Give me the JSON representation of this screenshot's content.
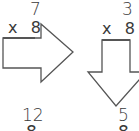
{
  "problems": [
    {
      "top_number": "7",
      "multiplier_sign": "x",
      "multiplier": "8",
      "arrow_direction": "right",
      "result_number": "12",
      "result_cut_char": "8"
    },
    {
      "top_number": "3",
      "multiplier_sign": "x",
      "multiplier": "8",
      "arrow_direction": "down",
      "result_number": "5",
      "result_cut_char": "8"
    }
  ],
  "colors": {
    "stroke": "#555555",
    "text": "#3a3a3a",
    "background": "#ffffff"
  }
}
